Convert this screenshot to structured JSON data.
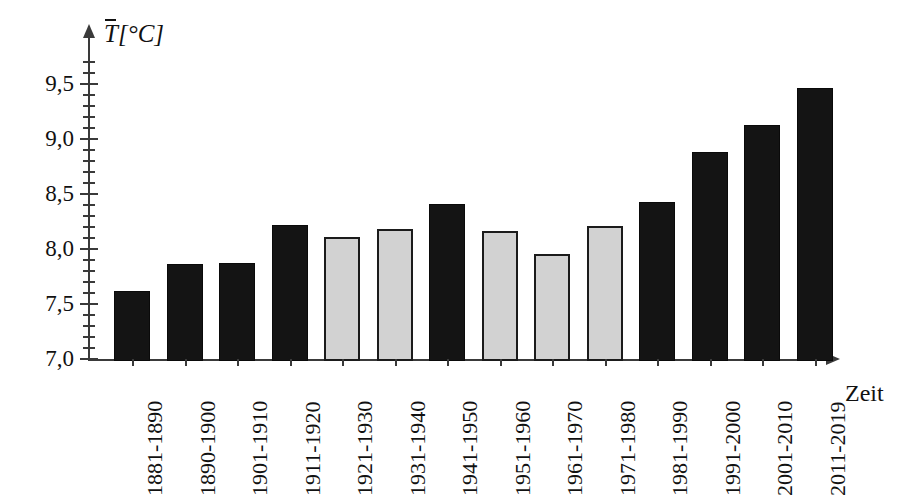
{
  "chart_data": {
    "type": "bar",
    "title": "",
    "subtitle": "",
    "xlabel": "Zeit",
    "ylabel": "T̄[°C]",
    "ylabel_parts": {
      "symbol": "T",
      "unit": "[°C]"
    },
    "categories": [
      "1881-1890",
      "1890-1900",
      "1901-1910",
      "1911-1920",
      "1921-1930",
      "1931-1940",
      "1941-1950",
      "1951-1960",
      "1961-1970",
      "1971-1980",
      "1981-1990",
      "1991-2000",
      "2001-2010",
      "2011-2019"
    ],
    "values": [
      7.64,
      7.88,
      7.89,
      8.24,
      8.13,
      8.2,
      8.43,
      8.18,
      7.97,
      8.23,
      8.45,
      8.9,
      9.15,
      9.48
    ],
    "bar_colors": [
      "#141414",
      "#141414",
      "#141414",
      "#141414",
      "#d2d2d2",
      "#d2d2d2",
      "#141414",
      "#d2d2d2",
      "#d2d2d2",
      "#d2d2d2",
      "#141414",
      "#141414",
      "#141414",
      "#141414"
    ],
    "bar_styles": [
      "dark",
      "dark",
      "dark",
      "dark",
      "light",
      "light",
      "dark",
      "light",
      "light",
      "light",
      "dark",
      "dark",
      "dark",
      "dark"
    ],
    "ylim": [
      7.0,
      9.75
    ],
    "ytick_values": [
      7.0,
      7.5,
      8.0,
      8.5,
      9.0,
      9.5
    ],
    "ytick_labels": [
      "7,0",
      "7,5",
      "8,0",
      "8,5",
      "9,0",
      "9,5"
    ],
    "yminor_step": 0.1,
    "grid": false,
    "legend": null,
    "axis_arrows": true,
    "decimal_separator": ","
  },
  "axes": {
    "y_title": "T̄[°C]",
    "x_title": "Zeit"
  },
  "icons": {
    "y_axis_arrow": "arrow-up-icon",
    "x_axis_arrow": "arrow-right-icon"
  }
}
